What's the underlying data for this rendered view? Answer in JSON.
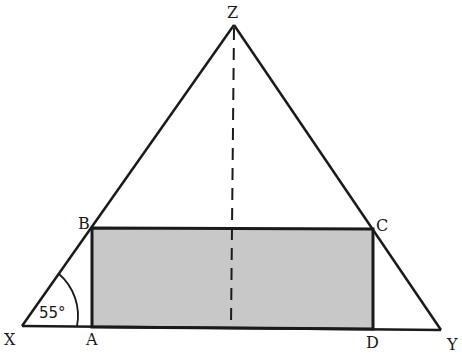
{
  "diagram": {
    "type": "geometry",
    "colors": {
      "stroke": "#1a1a1a",
      "rect_fill": "#c8c8c8",
      "background": "#ffffff"
    },
    "points": {
      "Z": {
        "label": "Z",
        "x": 234,
        "y": 25
      },
      "X": {
        "label": "X",
        "x": 22,
        "y": 326
      },
      "Y": {
        "label": "Y",
        "x": 441,
        "y": 330
      },
      "A": {
        "label": "A",
        "x": 92,
        "y": 327
      },
      "B": {
        "label": "B",
        "x": 92,
        "y": 228
      },
      "C": {
        "label": "C",
        "x": 373,
        "y": 229
      },
      "D": {
        "label": "D",
        "x": 373,
        "y": 329
      }
    },
    "angle": {
      "vertex": "X",
      "value": "55°"
    },
    "segments": [
      {
        "from": "X",
        "to": "Z",
        "style": "solid"
      },
      {
        "from": "Z",
        "to": "Y",
        "style": "solid"
      },
      {
        "from": "X",
        "to": "Y",
        "style": "solid"
      },
      {
        "from": "Z",
        "to": "base",
        "style": "dashed"
      }
    ],
    "rectangle": [
      "A",
      "B",
      "C",
      "D"
    ]
  }
}
